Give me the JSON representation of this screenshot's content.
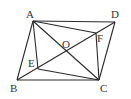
{
  "diagram": {
    "type": "geometry",
    "points": {
      "A": {
        "label": "A",
        "x": 33,
        "y": 21,
        "lx": 26,
        "ly": 18
      },
      "B": {
        "label": "B",
        "x": 17,
        "y": 80,
        "lx": 10,
        "ly": 92
      },
      "C": {
        "label": "C",
        "x": 99,
        "y": 80,
        "lx": 100,
        "ly": 92
      },
      "D": {
        "label": "D",
        "x": 115,
        "y": 22,
        "lx": 111,
        "ly": 18
      },
      "O": {
        "label": "O",
        "x": 66,
        "y": 51,
        "lx": 62,
        "ly": 48
      },
      "E": {
        "label": "E",
        "x": 38,
        "y": 69,
        "lx": 28,
        "ly": 67
      },
      "F": {
        "label": "F",
        "x": 96,
        "y": 33,
        "lx": 97,
        "ly": 42
      }
    },
    "segments": [
      [
        "A",
        "B"
      ],
      [
        "B",
        "C"
      ],
      [
        "C",
        "D"
      ],
      [
        "D",
        "A"
      ],
      [
        "A",
        "C"
      ],
      [
        "B",
        "D"
      ],
      [
        "A",
        "E"
      ],
      [
        "A",
        "F"
      ],
      [
        "C",
        "E"
      ],
      [
        "C",
        "F"
      ]
    ],
    "colors": {
      "line": "#2a2a2a",
      "label": "#333333",
      "background": "#ffffff"
    }
  }
}
